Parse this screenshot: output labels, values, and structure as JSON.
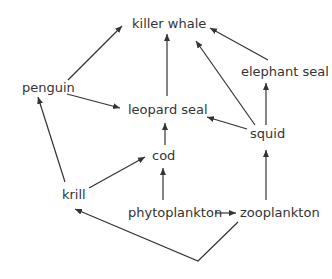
{
  "diagram": {
    "type": "food-web",
    "nodes": [
      {
        "id": "killer_whale",
        "label": "killer whale",
        "x": 132,
        "y": 16
      },
      {
        "id": "elephant_seal",
        "label": "elephant seal",
        "x": 241,
        "y": 64
      },
      {
        "id": "penguin",
        "label": "penguin",
        "x": 22,
        "y": 80
      },
      {
        "id": "leopard_seal",
        "label": "leopard seal",
        "x": 128,
        "y": 102
      },
      {
        "id": "squid",
        "label": "squid",
        "x": 250,
        "y": 126
      },
      {
        "id": "cod",
        "label": "cod",
        "x": 152,
        "y": 148
      },
      {
        "id": "krill",
        "label": "krill",
        "x": 62,
        "y": 187
      },
      {
        "id": "phytoplankton",
        "label": "phytoplankton",
        "x": 128,
        "y": 205
      },
      {
        "id": "zooplankton",
        "label": "zooplankton",
        "x": 240,
        "y": 205
      }
    ],
    "edges": [
      {
        "from": "penguin",
        "to": "killer_whale"
      },
      {
        "from": "leopard_seal",
        "to": "killer_whale"
      },
      {
        "from": "squid",
        "to": "killer_whale"
      },
      {
        "from": "elephant_seal",
        "to": "killer_whale"
      },
      {
        "from": "penguin",
        "to": "leopard_seal"
      },
      {
        "from": "squid",
        "to": "leopard_seal"
      },
      {
        "from": "squid",
        "to": "elephant_seal"
      },
      {
        "from": "cod",
        "to": "leopard_seal"
      },
      {
        "from": "krill",
        "to": "penguin"
      },
      {
        "from": "krill",
        "to": "cod"
      },
      {
        "from": "phytoplankton",
        "to": "cod"
      },
      {
        "from": "phytoplankton",
        "to": "zooplankton"
      },
      {
        "from": "zooplankton",
        "to": "squid"
      },
      {
        "from": "zooplankton",
        "to": "krill"
      }
    ]
  }
}
